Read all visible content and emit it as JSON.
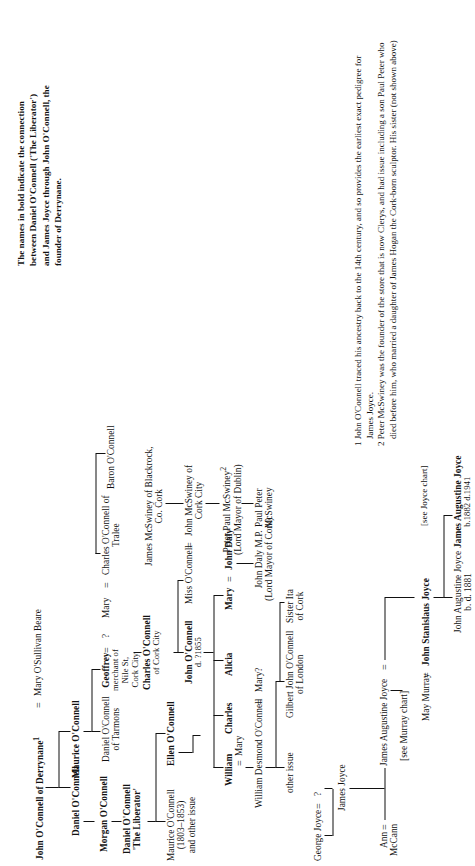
{
  "chart": {
    "title_note": [
      "The names in bold indicate the connection",
      "between Daniel O'Connell ('The Liberator')",
      "and James Joyce through John O'Connell, the",
      "founder of Derrynane."
    ],
    "people": {
      "john_oconnell_derrynane": {
        "name": "John O'Connell of Derrynane",
        "sup": "1"
      },
      "mary_osullivan_beare": {
        "name": "Mary O'Sullivan Beare"
      },
      "maurice_oconnell": {
        "name": "Maurice O'Connell"
      },
      "daniel_oconnell_1": {
        "name": "Daniel O'Connell"
      },
      "morgan_oconnell": {
        "name": "Morgan O'Connell"
      },
      "daniel_oconnell_liberator": {
        "line1": "Daniel O'Connell",
        "line2": "'The Liberator'"
      },
      "maurice_oconnell_1803": {
        "line1": "Maurice O'Connell",
        "line2": "(1803–1853)",
        "line3": "and other issue"
      },
      "daniel_oconnell_tarmons": {
        "line1": "Daniel O'Connell",
        "line2": "of Tarmons"
      },
      "geoffrey": {
        "line1": "Geoffrey",
        "line2": "merchant of",
        "line3": "Nile St,",
        "line4": "Cork City"
      },
      "unknown_q": {
        "name": "?"
      },
      "mary_tralee": {
        "name": "Mary"
      },
      "charles_oconnell_tralee": {
        "line1": "Charles O'Connell of",
        "line2": "Tralee"
      },
      "baron_oconnell": {
        "name": "Baron O'Connell"
      },
      "charles_oconnell_cork": {
        "line1": "Charles O'Connell",
        "line2": "of Cork City"
      },
      "john_oconnell_d1855": {
        "line1": "John O'Connell",
        "line2": "d. ?1855"
      },
      "miss_oconnell": {
        "name": "Miss O'Connell"
      },
      "john_mcswiney_cork": {
        "line1": "John McSwiney of",
        "line2": "Cork City"
      },
      "james_mcswiney_blackrock": {
        "line1": "James McSwiney of Blackrock,",
        "line2": "Co. Cork"
      },
      "peter_paul_mcswiney": {
        "line1": "Peter Paul McSwiney",
        "sup": "2",
        "line2": "(Lord Mayor of Dublin)"
      },
      "paul_peter_mcswiney": {
        "line1": "Paul Peter",
        "line2": "McSwiney"
      },
      "ellen_oconnell": {
        "name": "Ellen O'Connell"
      },
      "william": {
        "name": "William"
      },
      "charles": {
        "name": "Charles"
      },
      "alicia": {
        "name": "Alicia"
      },
      "mary_daly": {
        "name": "Mary"
      },
      "john_daly": {
        "name": "John Daly"
      },
      "john_daly_mp": {
        "line1": "John Daly M.P.",
        "line2": "(Lord Mayor of Cork)"
      },
      "mary_w": {
        "name": "Mary"
      },
      "william_desmond_oconnell": {
        "name": "William Desmond O'Connell"
      },
      "mary_q": {
        "name": "Mary?"
      },
      "other_issue": {
        "name": "other issue"
      },
      "gilbert_john_oconnell": {
        "line1": "Gilbert John O'Connell",
        "line2": "of London"
      },
      "sister_ita": {
        "line1": "Sister Ita",
        "line2": "of Cork"
      },
      "george_joyce": {
        "name": "George Joyce"
      },
      "george_joyce_spouse": {
        "name": "?"
      },
      "james_joyce_elder": {
        "name": "James Joyce"
      },
      "ann_mccann": {
        "line1": "Ann",
        "line2": "McCann"
      },
      "james_augustine_joyce_elder": {
        "name": "James Augustine Joyce"
      },
      "see_murray_chart": {
        "name": "[see Murray chart]"
      },
      "may_murray": {
        "name": "May Murray"
      },
      "john_stanislaus_joyce": {
        "name": "John Stanislaus Joyce"
      },
      "john_augustine_joyce": {
        "line1": "John Augustine Joyce",
        "line2": "b. d. 1881"
      },
      "james_augustine_joyce_author": {
        "line1": "James Augustine Joyce",
        "line2": "b.1882 d.1941"
      },
      "see_joyce_chart": {
        "name": "[see Joyce chart]"
      }
    },
    "marriage_symbol": "=",
    "footnotes": [
      {
        "number": "1",
        "lines": [
          "John O'Connell traced his ancestry back to the 14th century, and so provides the earliest exact pedigree for",
          "James Joyce."
        ]
      },
      {
        "number": "2",
        "lines": [
          "Peter McSwiney was the founder of the store that is now Clerys, and had issue including a son Paul Peter who",
          "died before him, who married a daughter of James Hogan the Cork-born sculptor. His sister (not shown above)"
        ]
      }
    ]
  }
}
